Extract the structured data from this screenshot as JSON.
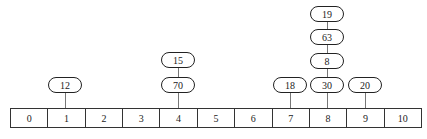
{
  "diagram": {
    "type": "hash-table-separate-chaining",
    "buckets": [
      "0",
      "1",
      "2",
      "3",
      "4",
      "5",
      "6",
      "7",
      "8",
      "9",
      "10"
    ],
    "chains": {
      "1": [
        "12"
      ],
      "4": [
        "70",
        "15"
      ],
      "7": [
        "18"
      ],
      "8": [
        "30",
        "8",
        "63",
        "19"
      ],
      "9": [
        "20"
      ]
    }
  },
  "nodes": {
    "b1_0": "12",
    "b4_0": "70",
    "b4_1": "15",
    "b7_0": "18",
    "b8_0": "30",
    "b8_1": "8",
    "b8_2": "63",
    "b8_3": "19",
    "b9_0": "20"
  }
}
